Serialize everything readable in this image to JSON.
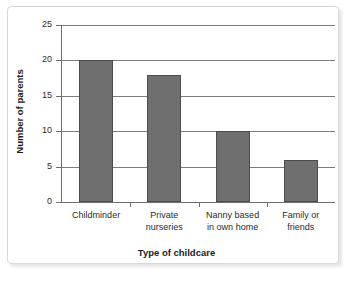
{
  "chart_data": {
    "type": "bar",
    "title": "",
    "xlabel": "Type of childcare",
    "ylabel": "Number of parents",
    "categories": [
      "Childminder",
      "Private nurseries",
      "Nanny based in own home",
      "Family or friends"
    ],
    "category_lines": [
      [
        "Childminder"
      ],
      [
        "Private",
        "nurseries"
      ],
      [
        "Nanny based",
        "in own home"
      ],
      [
        "Family or",
        "friends"
      ]
    ],
    "values": [
      20,
      18,
      10,
      6
    ],
    "ylim": [
      0,
      25
    ],
    "yticks": [
      0,
      5,
      10,
      15,
      20,
      25
    ],
    "ytick_labels": [
      "0",
      "5",
      "10",
      "15",
      "20",
      "25"
    ],
    "grid": true,
    "legend": "none",
    "bar_color": "#706f70",
    "bar_edge_color": "#4c4c4c",
    "grid_color": "#7c7c7c",
    "axis_color": "#6e6e6e",
    "frame_color": "#d8d8d8",
    "background": "#ffffff"
  }
}
